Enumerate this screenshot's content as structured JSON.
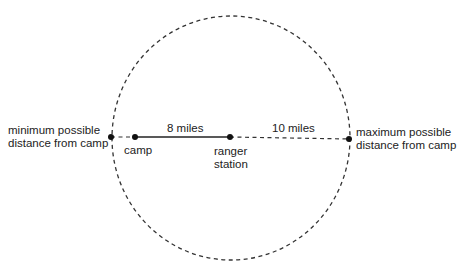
{
  "diagram": {
    "labels": {
      "min_distance": [
        "minimum possible",
        "distance from camp"
      ],
      "max_distance": [
        "maximum possible",
        "distance from camp"
      ],
      "camp": "camp",
      "ranger_station": [
        "ranger",
        "station"
      ],
      "segment_camp_ranger": "8 miles",
      "segment_ranger_max": "10 miles"
    },
    "circle": {
      "cx": 231,
      "cy": 138,
      "r": 121,
      "style": "dashed"
    },
    "points": {
      "min": [
        111,
        137
      ],
      "camp": [
        135,
        137
      ],
      "ranger": [
        230,
        137
      ],
      "max": [
        349,
        139
      ]
    }
  }
}
